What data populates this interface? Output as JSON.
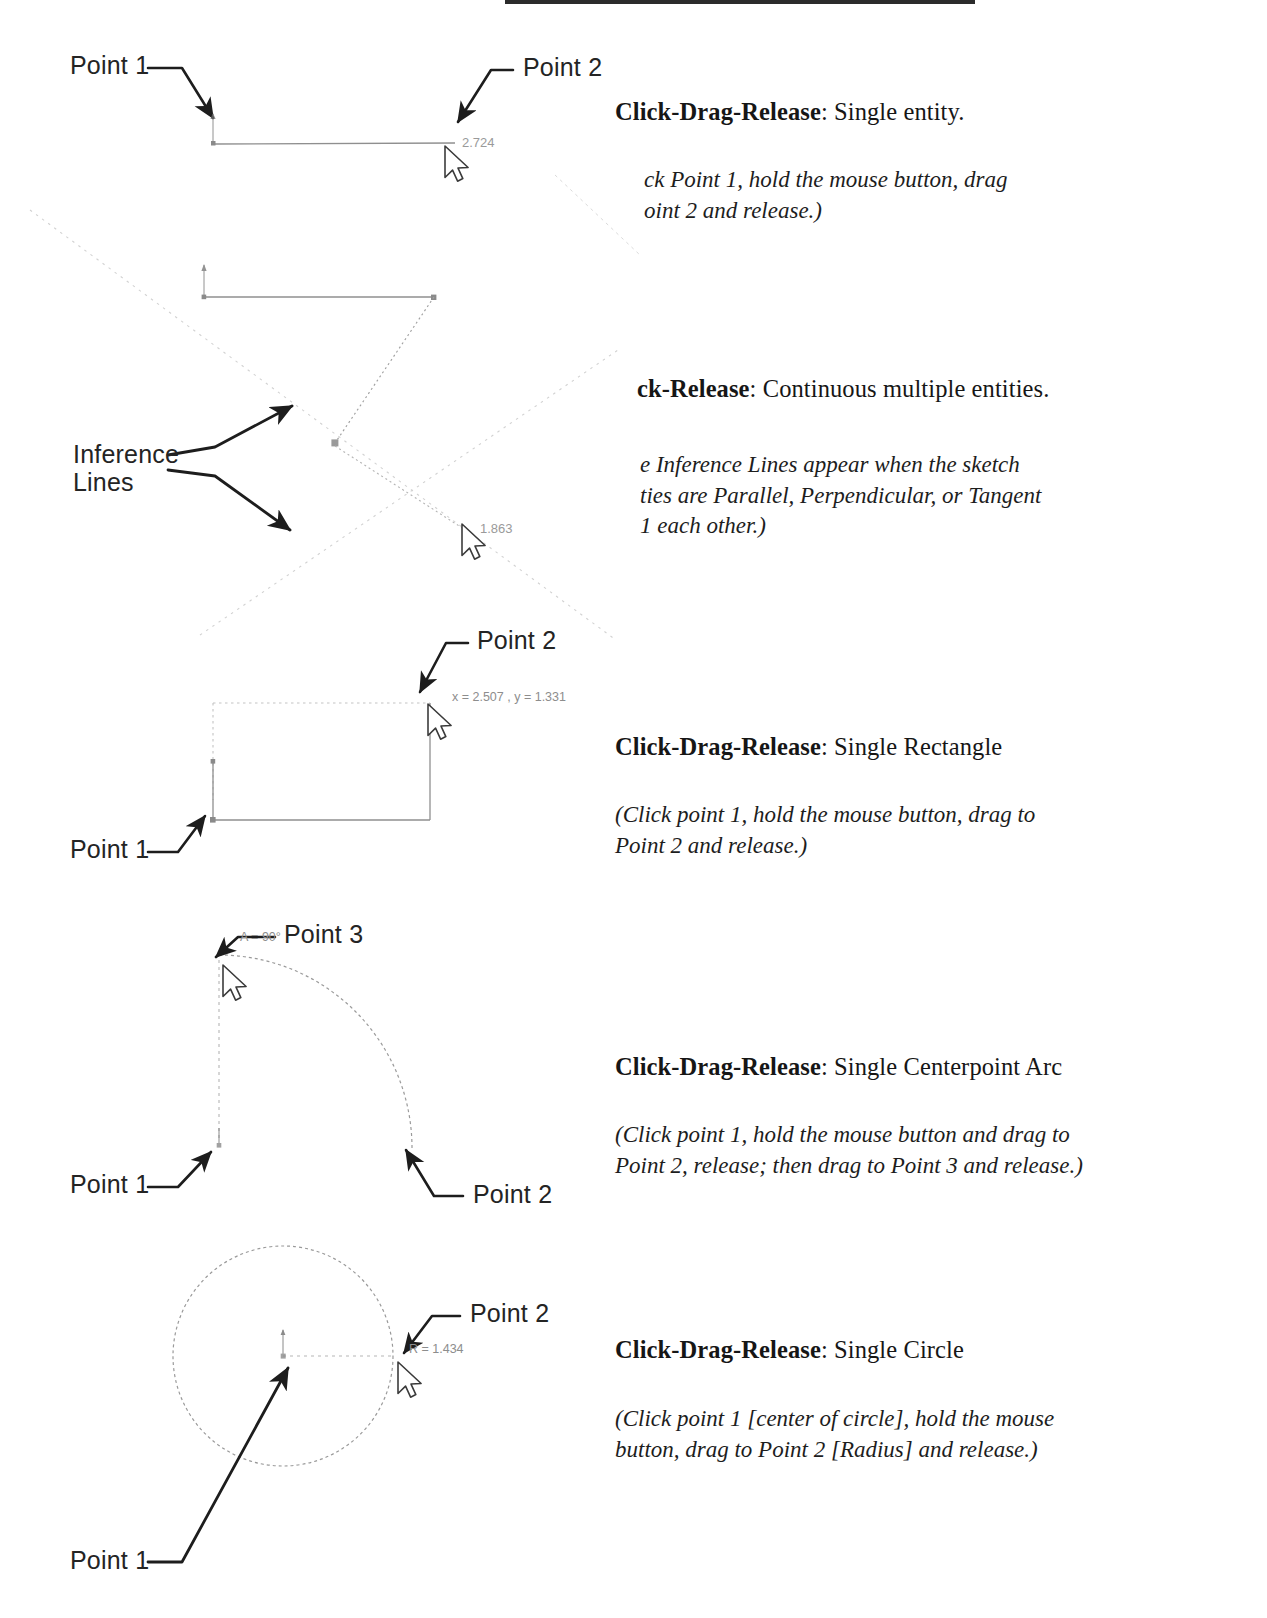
{
  "page": {
    "background": "#ffffff",
    "ink_color": "#242424",
    "cad_line_color": "#9a9a9a",
    "inference_line_color": "#c9c9c9"
  },
  "sections": [
    {
      "id": "line",
      "heading_bold": "Click-Drag-Release",
      "heading_rest": ": Single entity.",
      "note_lines": [
        "ck Point 1, hold the mouse button, drag",
        "oint 2 and release.)"
      ],
      "note_clipped": true
    },
    {
      "id": "multi",
      "heading_bold": "ck-Release",
      "heading_rest": ": Continuous multiple entities.",
      "note_lines": [
        "e Inference Lines appear when the sketch",
        "ties are Parallel, Perpendicular, or Tangent",
        "1 each other.)"
      ],
      "note_clipped": true
    },
    {
      "id": "rectangle",
      "heading_bold": "Click-Drag-Release",
      "heading_rest": ": Single Rectangle",
      "note_lines": [
        "(Click point 1, hold the mouse button, drag to",
        "Point 2 and release.)"
      ],
      "note_clipped": false
    },
    {
      "id": "arc",
      "heading_bold": "Click-Drag-Release",
      "heading_rest": ": Single Centerpoint Arc",
      "note_lines": [
        "(Click point 1, hold the mouse button and drag to",
        "Point 2, release; then drag to Point 3 and release.)"
      ],
      "note_clipped": false
    },
    {
      "id": "circle",
      "heading_bold": "Click-Drag-Release",
      "heading_rest": ": Single Circle",
      "note_lines": [
        "(Click point 1 [center of circle], hold the mouse",
        "button, drag to Point 2 [Radius] and release.)"
      ],
      "note_clipped": false
    }
  ],
  "callouts": {
    "line_point1": "Point 1",
    "line_point2": "Point 2",
    "inference_lines_l1": "Inference",
    "inference_lines_l2": "Lines",
    "rect_point1": "Point 1",
    "rect_point2": "Point 2",
    "arc_point1": "Point 1",
    "arc_point2": "Point 2",
    "arc_point3": "Point 3",
    "circle_point1": "Point 1",
    "circle_point2": "Point 2"
  },
  "cad_readouts": {
    "line_length": "2.724",
    "multiline_length": "1.863",
    "rect_coords": "x = 2.507 , y = 1.331",
    "arc_angle": "A = 90°",
    "circle_radius": "R = 1.434"
  },
  "icons": {
    "cursor": "mouse-cursor-icon",
    "arrowhead": "leader-arrow-icon",
    "origin_marker": "sketch-origin-icon",
    "endpoint_marker": "sketch-endpoint-icon"
  }
}
